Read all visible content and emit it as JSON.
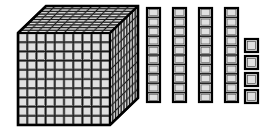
{
  "figure": {
    "title": "Base-ten blocks place value model",
    "description": "One thousand cube, four tens rods, and four unit cubes",
    "total_value": "1044",
    "background_color": "#ffffff"
  },
  "palette": {
    "fill": "#d7d7d7",
    "fill_light": "#e0e0e0",
    "fill_top": "#cfcfcf",
    "fill_side": "#c4c4c4",
    "stroke": "#1a1a1a",
    "stroke_inner": "#3d3d3d",
    "outline": "#000000"
  },
  "groups": [
    {
      "name": "thousands",
      "label": "thousand-cube",
      "count": "1",
      "unit_value": "1000",
      "value": "1000",
      "dimensions": "10 x 10 x 10",
      "geometry": {
        "front_x": 18,
        "front_y": 33,
        "front_w": 92,
        "front_h": 92,
        "depth_dx": 28,
        "depth_dy": -27,
        "cells_per_side": 10
      }
    },
    {
      "name": "tens",
      "label": "ten-rod",
      "count": "4",
      "unit_value": "10",
      "value": "40",
      "dimensions": "1 x 10",
      "geometry": {
        "start_x": 147,
        "y": 8,
        "w": 13,
        "h": 94,
        "gap": 26,
        "cells": 10
      }
    },
    {
      "name": "ones",
      "label": "unit-cube",
      "count": "4",
      "unit_value": "1",
      "value": "4",
      "dimensions": "1 x 1",
      "geometry": {
        "x": 245,
        "start_y": 39,
        "w": 13,
        "h": 13,
        "gap": 17
      }
    }
  ],
  "equation": {
    "terms": [
      "1000",
      "40",
      "4"
    ],
    "operator": "+",
    "equals": "=",
    "result": "1044"
  }
}
